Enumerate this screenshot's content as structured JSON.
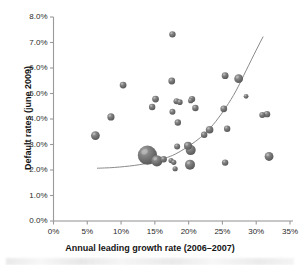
{
  "chart_data": {
    "type": "scatter",
    "title": "",
    "xlabel": "Annual leading growth rate (2006–2007)",
    "ylabel": "Default rates (june 2009)",
    "xlim": [
      0,
      35
    ],
    "ylim": [
      0,
      8
    ],
    "xticks": [
      "0%",
      "5%",
      "10%",
      "15%",
      "20%",
      "25%",
      "30%",
      "35%"
    ],
    "xtick_values": [
      0,
      5,
      10,
      15,
      20,
      25,
      30,
      35
    ],
    "yticks": [
      "0.0%",
      "1.0%",
      "2.0%",
      "3.0%",
      "4.0%",
      "5.0%",
      "6.0%",
      "7.0%",
      "8.0%"
    ],
    "ytick_values": [
      0,
      1,
      2,
      3,
      4,
      5,
      6,
      7,
      8
    ],
    "grid": false,
    "legend": null,
    "marker_style": "3d-sphere-bubble",
    "marker_color": "#6e6e6e",
    "point_label": "bubble",
    "points": [
      {
        "x": 6.2,
        "y": 3.35,
        "r": 4.4
      },
      {
        "x": 8.5,
        "y": 4.08,
        "r": 3.6
      },
      {
        "x": 10.3,
        "y": 5.33,
        "r": 3.4
      },
      {
        "x": 13.9,
        "y": 2.58,
        "r": 9.6
      },
      {
        "x": 15.3,
        "y": 2.36,
        "r": 5.6
      },
      {
        "x": 16.3,
        "y": 2.42,
        "r": 3.2
      },
      {
        "x": 15.1,
        "y": 4.78,
        "r": 3.4
      },
      {
        "x": 14.6,
        "y": 4.47,
        "r": 3.2
      },
      {
        "x": 17.4,
        "y": 2.37,
        "r": 2.6
      },
      {
        "x": 17.8,
        "y": 2.3,
        "r": 2.6
      },
      {
        "x": 17.6,
        "y": 7.32,
        "r": 3.2
      },
      {
        "x": 17.5,
        "y": 5.49,
        "r": 3.4
      },
      {
        "x": 17.6,
        "y": 4.28,
        "r": 3.0
      },
      {
        "x": 18.0,
        "y": 2.05,
        "r": 2.6
      },
      {
        "x": 18.3,
        "y": 2.92,
        "r": 3.0
      },
      {
        "x": 18.2,
        "y": 4.7,
        "r": 3.0
      },
      {
        "x": 18.7,
        "y": 4.66,
        "r": 2.8
      },
      {
        "x": 18.4,
        "y": 3.86,
        "r": 3.2
      },
      {
        "x": 19.9,
        "y": 2.95,
        "r": 4.0
      },
      {
        "x": 20.3,
        "y": 2.78,
        "r": 5.0
      },
      {
        "x": 20.2,
        "y": 2.21,
        "r": 5.0
      },
      {
        "x": 20.5,
        "y": 4.78,
        "r": 3.2
      },
      {
        "x": 20.3,
        "y": 4.72,
        "r": 2.6
      },
      {
        "x": 21.0,
        "y": 4.43,
        "r": 3.2
      },
      {
        "x": 22.3,
        "y": 3.38,
        "r": 3.2
      },
      {
        "x": 23.1,
        "y": 3.58,
        "r": 3.8
      },
      {
        "x": 25.2,
        "y": 4.4,
        "r": 3.4
      },
      {
        "x": 25.4,
        "y": 5.7,
        "r": 3.4
      },
      {
        "x": 25.7,
        "y": 3.62,
        "r": 3.2
      },
      {
        "x": 25.4,
        "y": 2.29,
        "r": 3.2
      },
      {
        "x": 27.4,
        "y": 5.58,
        "r": 4.4
      },
      {
        "x": 28.5,
        "y": 4.89,
        "r": 2.4
      },
      {
        "x": 30.9,
        "y": 4.16,
        "r": 3.0
      },
      {
        "x": 31.6,
        "y": 4.19,
        "r": 3.2
      },
      {
        "x": 31.9,
        "y": 2.53,
        "r": 4.4
      }
    ],
    "trend_line": {
      "style": "solid",
      "color": "#8a8a8a",
      "points": [
        {
          "x": 6.5,
          "y": 2.07
        },
        {
          "x": 9.0,
          "y": 2.1
        },
        {
          "x": 12.0,
          "y": 2.18
        },
        {
          "x": 14.5,
          "y": 2.3
        },
        {
          "x": 16.5,
          "y": 2.46
        },
        {
          "x": 18.0,
          "y": 2.62
        },
        {
          "x": 19.5,
          "y": 2.85
        },
        {
          "x": 21.0,
          "y": 3.12
        },
        {
          "x": 22.5,
          "y": 3.45
        },
        {
          "x": 24.0,
          "y": 3.9
        },
        {
          "x": 25.5,
          "y": 4.45
        },
        {
          "x": 27.0,
          "y": 5.1
        },
        {
          "x": 28.5,
          "y": 5.9
        },
        {
          "x": 30.0,
          "y": 6.7
        },
        {
          "x": 31.0,
          "y": 7.22
        }
      ]
    }
  }
}
